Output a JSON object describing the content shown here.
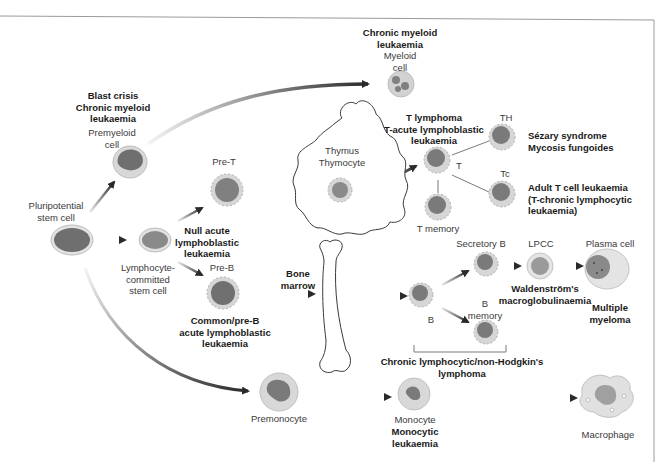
{
  "diagram": {
    "type": "haematopoietic lineage / leukaemia classification diagram",
    "colors": {
      "cell_body": "#c9c9c9",
      "cell_rim": "#e6e6e6",
      "nucleus": "#6f6f6f",
      "arrow": "#2a2a2a",
      "frame": "#9a9a9a"
    },
    "nodes": {
      "pluripotential": {
        "label_line1": "Pluripotential",
        "label_line2": "stem cell"
      },
      "premyeloid": {
        "label_line1": "Premyeloid",
        "label_line2": "cell",
        "disease_line1": "Blast crisis",
        "disease_line2": "Chronic myeloid",
        "disease_line3": "leukaemia"
      },
      "myeloid": {
        "label_line1": "Myeloid",
        "label_line2": "cell",
        "disease_line1": "Chronic myeloid",
        "disease_line2": "leukaemia"
      },
      "lymphocyte_committed": {
        "label_line1": "Lymphocyte-",
        "label_line2": "committed",
        "label_line3": "stem cell"
      },
      "pre_t": {
        "label": "Pre-T",
        "disease_line1": "Null acute",
        "disease_line2": "lymphoblastic",
        "disease_line3": "leukaemia"
      },
      "thymus": {
        "label_line1": "Thymus",
        "label_line2": "Thymocyte"
      },
      "t_cell": {
        "label": "T",
        "disease_line1": "T lymphoma",
        "disease_line2": "T-acute lymphoblastic",
        "disease_line3": "leukaemia"
      },
      "th": {
        "label": "TH",
        "disease_line1": "Sézary syndrome",
        "disease_line2": "Mycosis fungoides"
      },
      "tc": {
        "label": "Tc",
        "disease_line1": "Adult T cell leukaemia",
        "disease_line2": "(T-chronic lymphocytic",
        "disease_line3": "leukaemia)"
      },
      "t_memory": {
        "label": "T memory"
      },
      "pre_b": {
        "label": "Pre-B",
        "disease_line1": "Common/pre-B",
        "disease_line2": "acute lymphoblastic",
        "disease_line3": "leukaemia"
      },
      "bone_marrow": {
        "label_line1": "Bone",
        "label_line2": "marrow"
      },
      "b_cell": {
        "label": "B"
      },
      "secretory_b": {
        "label": "Secretory B"
      },
      "b_memory": {
        "label_line1": "B",
        "label_line2": "memory"
      },
      "lpcc": {
        "label": "LPCC",
        "disease_line1": "Waldenström's",
        "disease_line2": "macroglobulinaemia"
      },
      "plasma_cell": {
        "label": "Plasma cell",
        "disease_line1": "Multiple",
        "disease_line2": "myeloma"
      },
      "b_group": {
        "disease_line1": "Chronic lymphocytic/non-Hodgkin's",
        "disease_line2": "lymphoma"
      },
      "premonocyte": {
        "label": "Premonocyte"
      },
      "monocyte": {
        "label": "Monocyte",
        "disease_line1": "Monocytic",
        "disease_line2": "leukaemia"
      },
      "macrophage": {
        "label": "Macrophage"
      }
    },
    "edges": [
      [
        "pluripotential",
        "premyeloid"
      ],
      [
        "premyeloid",
        "myeloid"
      ],
      [
        "pluripotential",
        "lymphocyte_committed"
      ],
      [
        "pluripotential",
        "premonocyte"
      ],
      [
        "lymphocyte_committed",
        "pre_t"
      ],
      [
        "lymphocyte_committed",
        "pre_b"
      ],
      [
        "pre_t",
        "thymus"
      ],
      [
        "thymus",
        "t_cell"
      ],
      [
        "t_cell",
        "th"
      ],
      [
        "t_cell",
        "tc"
      ],
      [
        "t_cell",
        "t_memory"
      ],
      [
        "pre_b",
        "bone_marrow"
      ],
      [
        "bone_marrow",
        "b_cell"
      ],
      [
        "b_cell",
        "secretory_b"
      ],
      [
        "b_cell",
        "b_memory"
      ],
      [
        "secretory_b",
        "lpcc"
      ],
      [
        "lpcc",
        "plasma_cell"
      ],
      [
        "premonocyte",
        "monocyte"
      ],
      [
        "monocyte",
        "macrophage"
      ]
    ]
  }
}
